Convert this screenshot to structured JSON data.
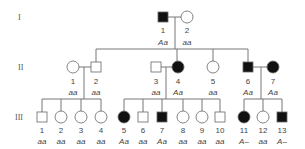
{
  "generations": [
    "I",
    "II",
    "III"
  ],
  "individuals": {
    "I1": {
      "num": "1",
      "gt": "Aa",
      "sex": "male",
      "affected": true
    },
    "I2": {
      "num": "2",
      "gt": "aa",
      "sex": "female",
      "affected": false
    },
    "II1": {
      "num": "1",
      "gt": "aa",
      "sex": "female",
      "affected": false
    },
    "II2": {
      "num": "2",
      "gt": "aa",
      "sex": "male",
      "affected": false
    },
    "II3": {
      "num": "3",
      "gt": "aa",
      "sex": "male",
      "affected": false
    },
    "II4": {
      "num": "4",
      "gt": "Aa",
      "sex": "female",
      "affected": true
    },
    "II5": {
      "num": "5",
      "gt": "aa",
      "sex": "female",
      "affected": false
    },
    "II6": {
      "num": "6",
      "gt": "Aa",
      "sex": "male",
      "affected": true
    },
    "II7": {
      "num": "7",
      "gt": "Aa",
      "sex": "female",
      "affected": true
    },
    "III1": {
      "num": "1",
      "gt": "aa"
    },
    "III2": {
      "num": "2",
      "gt": "aa"
    },
    "III3": {
      "num": "3",
      "gt": "aa"
    },
    "III4": {
      "num": "4",
      "gt": "aa"
    },
    "III5": {
      "num": "5",
      "gt": "Aa"
    },
    "III6": {
      "num": "6",
      "gt": "aa"
    },
    "III7": {
      "num": "7",
      "gt": "Aa"
    },
    "III8": {
      "num": "8",
      "gt": "aa"
    },
    "III9": {
      "num": "9",
      "gt": "aa"
    },
    "III10": {
      "num": "10",
      "gt": "aa"
    },
    "III11": {
      "num": "11",
      "gt": "A–"
    },
    "III12": {
      "num": "12",
      "gt": "aa"
    },
    "III13": {
      "num": "13",
      "gt": "A–"
    }
  }
}
